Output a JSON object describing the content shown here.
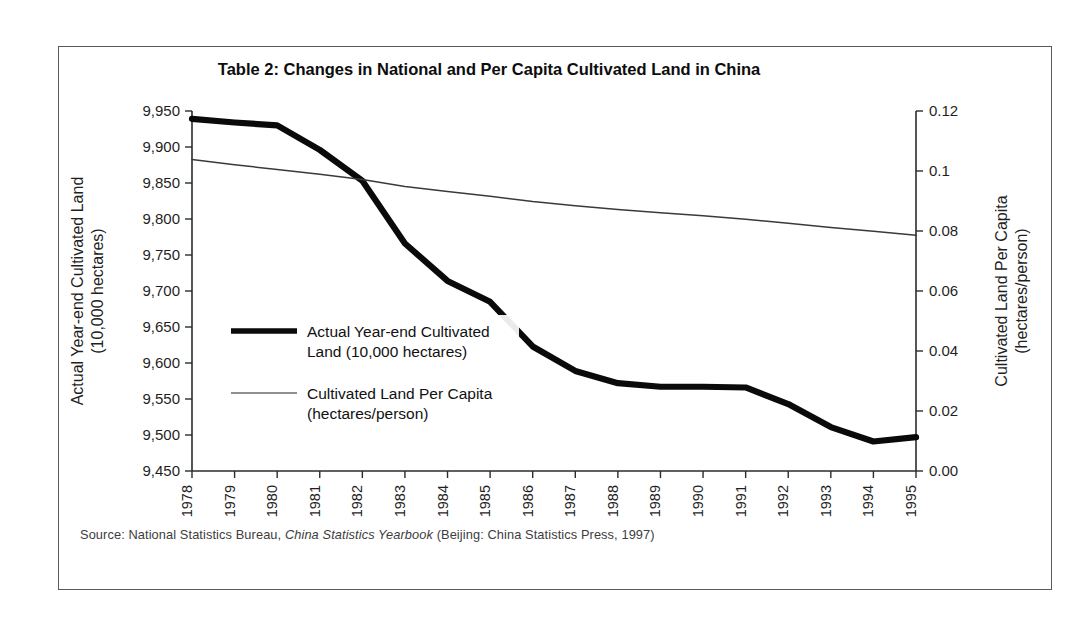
{
  "figure": {
    "title": "Table 2: Changes in National and Per Capita Cultivated Land in China",
    "source_prefix": "Source: National Statistics Bureau, ",
    "source_italic": "China Statistics Yearbook",
    "source_suffix": " (Beijing: China Statistics Press, 1997)",
    "border_color": "#5a5a5a"
  },
  "chart_data": {
    "type": "line",
    "title": "Table 2: Changes in National and Per Capita Cultivated Land in China",
    "xlabel": "",
    "ylabel": "Actual Year-end Cultivated Land (10,000 hectares)",
    "y2label": "Cultivated Land Per Capita (hectares/person)",
    "categories": [
      "1978",
      "1979",
      "1980",
      "1981",
      "1982",
      "1983",
      "1984",
      "1985",
      "1986",
      "1987",
      "1988",
      "1989",
      "1990",
      "1991",
      "1992",
      "1993",
      "1994",
      "1995"
    ],
    "ylim": [
      9450,
      9950
    ],
    "yticks": [
      9450,
      9500,
      9550,
      9600,
      9650,
      9700,
      9750,
      9800,
      9850,
      9900,
      9950
    ],
    "ytick_labels": [
      "9,450",
      "9,500",
      "9,550",
      "9,600",
      "9,650",
      "9,700",
      "9,750",
      "9,800",
      "9,850",
      "9,900",
      "9,950"
    ],
    "y2lim": [
      0.0,
      0.12
    ],
    "y2ticks": [
      0.0,
      0.02,
      0.04,
      0.06,
      0.08,
      0.1,
      0.12
    ],
    "y2tick_labels": [
      "0.00",
      "0.02",
      "0.04",
      "0.06",
      "0.08",
      "0.1",
      "0.12"
    ],
    "grid": false,
    "legend_position": "center-left",
    "series": [
      {
        "name": "Actual Year-end Cultivated Land (10,000 hectares)",
        "legend_label_lines": [
          "Actual Year-end Cultivated",
          "Land (10,000 hectares)"
        ],
        "axis": "left",
        "color": "#0a0a0a",
        "width": 6.2,
        "values": [
          9939,
          9934,
          9930,
          9896,
          9853,
          9766,
          9714,
          9685,
          9623,
          9589,
          9572,
          9567,
          9567,
          9566,
          9543,
          9511,
          9491,
          9497
        ]
      },
      {
        "name": "Cultivated Land Per Capita (hectares/person)",
        "legend_label_lines": [
          "Cultivated Land Per Capita",
          "(hectares/person)"
        ],
        "axis": "right",
        "color": "#3a3a3a",
        "width": 1.5,
        "values": [
          0.1038,
          0.1021,
          0.1005,
          0.0989,
          0.0972,
          0.0948,
          0.0932,
          0.0916,
          0.0898,
          0.0884,
          0.0872,
          0.0861,
          0.0851,
          0.0839,
          0.0826,
          0.0812,
          0.0799,
          0.0786
        ]
      }
    ]
  }
}
